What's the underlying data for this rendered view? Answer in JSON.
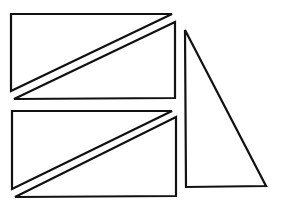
{
  "diagram": {
    "background": "#ffffff",
    "stroke_color": "#111111",
    "shapes": [
      {
        "name": "triangle-top-left-upper",
        "points": "11,14 172,14 11,91"
      },
      {
        "name": "triangle-top-left-lower",
        "points": "14,99 175,22 175,98"
      },
      {
        "name": "triangle-bottom-left-upper",
        "points": "12,111 172,111 12,189"
      },
      {
        "name": "triangle-bottom-left-lower",
        "points": "15,197 176,117 176,196"
      },
      {
        "name": "triangle-right-tall",
        "points": "185,30 186,187 266,186"
      }
    ]
  }
}
